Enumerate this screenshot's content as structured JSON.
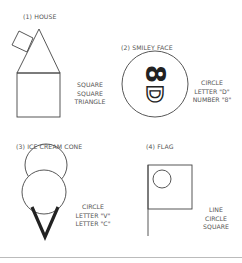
{
  "figures": [
    {
      "title": "(1) HOUSE",
      "shapes": [
        "SQUARE",
        "SQUARE",
        "TRIANGLE"
      ]
    },
    {
      "title": "(2) SMILEY FACE",
      "shapes": [
        "CIRCLE",
        "LETTER \"D\"",
        "NUMBER \"8\""
      ]
    },
    {
      "title": "(3) ICE CREAM CONE",
      "shapes": [
        "CIRCLE",
        "LETTER \"V\"",
        "LETTER \"C\""
      ]
    },
    {
      "title": "(4) FLAG",
      "shapes": [
        "LINE",
        "CIRCLE",
        "SQUARE"
      ]
    }
  ],
  "glyphs": {
    "eight": "8",
    "d": "D"
  },
  "colors": {
    "stroke": "#333333",
    "text": "#555555",
    "divider": "#bbbbbb"
  }
}
